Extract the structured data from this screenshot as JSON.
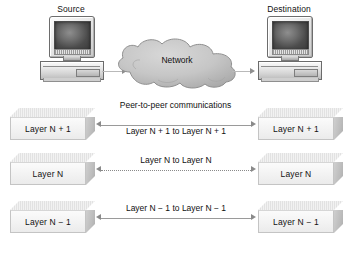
{
  "diagram": {
    "background": "#ffffff",
    "text_color": "#111111",
    "slab_fill": "#f4f4f4",
    "cloud_fill": "#c6c6c6",
    "arrow_color": "#8a8a8a"
  },
  "endpoints": {
    "source": {
      "label": "Source",
      "icon": "desktop-computer-icon"
    },
    "destination": {
      "label": "Destination",
      "icon": "desktop-computer-icon"
    }
  },
  "network": {
    "label": "Network",
    "icon": "cloud-icon"
  },
  "peer_title": "Peer-to-peer communications",
  "layers": [
    {
      "id": "layer-n-plus-1",
      "left_label": "Layer N + 1",
      "right_label": "Layer N + 1",
      "link_label": "Layer N + 1 to Layer N + 1",
      "link_style": "solid"
    },
    {
      "id": "layer-n",
      "left_label": "Layer N",
      "right_label": "Layer N",
      "link_label": "Layer N to Layer N",
      "link_style": "dotted"
    },
    {
      "id": "layer-n-minus-1",
      "left_label": "Layer N − 1",
      "right_label": "Layer N − 1",
      "link_label": "Layer N − 1 to Layer N − 1",
      "link_style": "solid"
    }
  ]
}
